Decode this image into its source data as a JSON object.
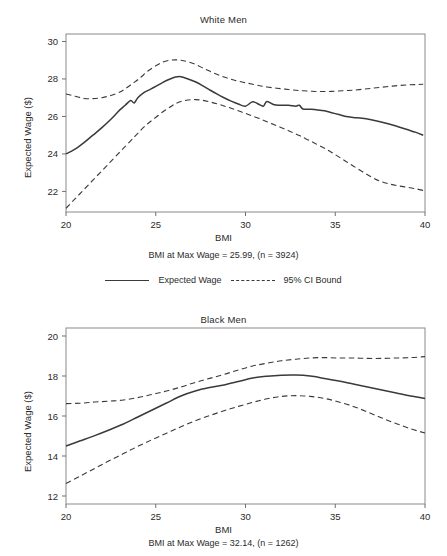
{
  "figure": {
    "shared_xlabel": "BMI",
    "shared_ylabel": "Expected Wage ($)",
    "legend": {
      "series_label": "Expected Wage",
      "ci_label": "95% CI Bound",
      "solid_icon": "solid-line-icon",
      "dashed_icon": "dashed-line-icon"
    }
  },
  "chart_data": [
    {
      "type": "line",
      "title": "White Men",
      "xlabel": "BMI",
      "ylabel": "Expected Wage ($)",
      "caption": "BMI at Max Wage = 25.99, (n = 3924)",
      "bmi_at_max_wage": 25.99,
      "n": 3924,
      "xlim": [
        20,
        40
      ],
      "ylim": [
        20.9,
        30.4
      ],
      "xticks": [
        20,
        25,
        30,
        35,
        40
      ],
      "yticks": [
        22,
        24,
        26,
        28,
        30
      ],
      "grid": false,
      "legend_position": "below",
      "x": [
        20.0,
        20.5,
        21.0,
        21.5,
        22.0,
        22.5,
        23.0,
        23.3,
        23.6,
        23.8,
        24.0,
        24.3,
        24.6,
        25.0,
        25.4,
        25.8,
        26.1,
        26.4,
        26.8,
        27.2,
        27.6,
        28.0,
        28.4,
        28.8,
        29.2,
        29.6,
        30.0,
        30.4,
        30.8,
        31.0,
        31.2,
        31.6,
        32.0,
        32.4,
        32.8,
        33.0,
        33.2,
        33.6,
        34.0,
        34.4,
        34.8,
        35.2,
        35.6,
        36.0,
        36.5,
        37.0,
        37.5,
        38.0,
        38.5,
        39.0,
        39.5,
        39.9
      ],
      "series": [
        {
          "name": "Expected Wage",
          "style": "solid",
          "values": [
            24.0,
            24.25,
            24.6,
            25.0,
            25.4,
            25.85,
            26.35,
            26.6,
            26.85,
            26.72,
            27.0,
            27.25,
            27.4,
            27.6,
            27.82,
            28.0,
            28.1,
            28.12,
            28.0,
            27.85,
            27.65,
            27.42,
            27.2,
            27.0,
            26.82,
            26.66,
            26.55,
            26.78,
            26.62,
            26.55,
            26.8,
            26.62,
            26.6,
            26.6,
            26.55,
            26.6,
            26.4,
            26.38,
            26.35,
            26.3,
            26.2,
            26.1,
            26.0,
            25.95,
            25.9,
            25.82,
            25.72,
            25.6,
            25.45,
            25.3,
            25.15,
            25.0
          ]
        },
        {
          "name": "95% CI Upper Bound",
          "style": "dashed",
          "values": [
            27.2,
            27.08,
            26.96,
            26.95,
            27.0,
            27.12,
            27.3,
            27.48,
            27.68,
            27.82,
            27.96,
            28.2,
            28.45,
            28.7,
            28.9,
            29.0,
            29.02,
            29.0,
            28.92,
            28.78,
            28.6,
            28.42,
            28.25,
            28.1,
            27.98,
            27.88,
            27.8,
            27.72,
            27.64,
            27.6,
            27.57,
            27.52,
            27.48,
            27.44,
            27.4,
            27.38,
            27.37,
            27.35,
            27.33,
            27.33,
            27.34,
            27.36,
            27.38,
            27.4,
            27.45,
            27.5,
            27.55,
            27.6,
            27.65,
            27.68,
            27.7,
            27.72
          ]
        },
        {
          "name": "95% CI Lower Bound",
          "style": "dashed",
          "values": [
            21.1,
            21.6,
            22.1,
            22.6,
            23.1,
            23.6,
            24.1,
            24.4,
            24.7,
            24.9,
            25.1,
            25.4,
            25.65,
            25.95,
            26.25,
            26.5,
            26.68,
            26.8,
            26.88,
            26.9,
            26.86,
            26.78,
            26.68,
            26.56,
            26.44,
            26.3,
            26.16,
            26.02,
            25.88,
            25.8,
            25.72,
            25.56,
            25.4,
            25.24,
            25.06,
            24.98,
            24.88,
            24.7,
            24.5,
            24.3,
            24.08,
            23.84,
            23.6,
            23.36,
            23.06,
            22.78,
            22.54,
            22.4,
            22.3,
            22.22,
            22.14,
            22.05
          ]
        }
      ]
    },
    {
      "type": "line",
      "title": "Black Men",
      "xlabel": "BMI",
      "ylabel": "Expected Wage ($)",
      "caption": "BMI at Max Wage = 32.14, (n = 1262)",
      "bmi_at_max_wage": 32.14,
      "n": 1262,
      "xlim": [
        20,
        40
      ],
      "ylim": [
        11.6,
        20.4
      ],
      "xticks": [
        20,
        25,
        30,
        35,
        40
      ],
      "yticks": [
        12,
        14,
        16,
        18,
        20
      ],
      "grid": false,
      "legend_position": "above",
      "x": [
        20.0,
        20.8,
        21.6,
        22.4,
        23.2,
        24.0,
        24.8,
        25.6,
        26.4,
        27.2,
        28.0,
        28.8,
        29.6,
        30.4,
        31.2,
        32.0,
        32.8,
        33.6,
        34.4,
        35.2,
        36.0,
        36.8,
        37.6,
        38.4,
        39.2,
        40.0
      ],
      "series": [
        {
          "name": "Expected Wage",
          "style": "solid",
          "values": [
            14.5,
            14.76,
            15.02,
            15.3,
            15.6,
            15.95,
            16.3,
            16.65,
            17.0,
            17.25,
            17.42,
            17.55,
            17.72,
            17.9,
            17.99,
            18.04,
            18.05,
            18.0,
            17.88,
            17.75,
            17.6,
            17.45,
            17.3,
            17.15,
            17.0,
            16.88
          ]
        },
        {
          "name": "95% CI Upper Bound",
          "style": "dashed",
          "values": [
            16.62,
            16.64,
            16.7,
            16.74,
            16.8,
            16.92,
            17.08,
            17.25,
            17.45,
            17.68,
            17.88,
            18.08,
            18.3,
            18.5,
            18.64,
            18.76,
            18.84,
            18.9,
            18.92,
            18.9,
            18.9,
            18.88,
            18.88,
            18.9,
            18.92,
            18.97
          ]
        },
        {
          "name": "95% CI Lower Bound",
          "style": "dashed",
          "values": [
            12.62,
            13.0,
            13.38,
            13.76,
            14.12,
            14.48,
            14.82,
            15.14,
            15.46,
            15.76,
            16.02,
            16.26,
            16.48,
            16.68,
            16.86,
            16.98,
            17.02,
            16.98,
            16.88,
            16.7,
            16.48,
            16.2,
            15.9,
            15.62,
            15.36,
            15.15
          ]
        }
      ]
    }
  ]
}
